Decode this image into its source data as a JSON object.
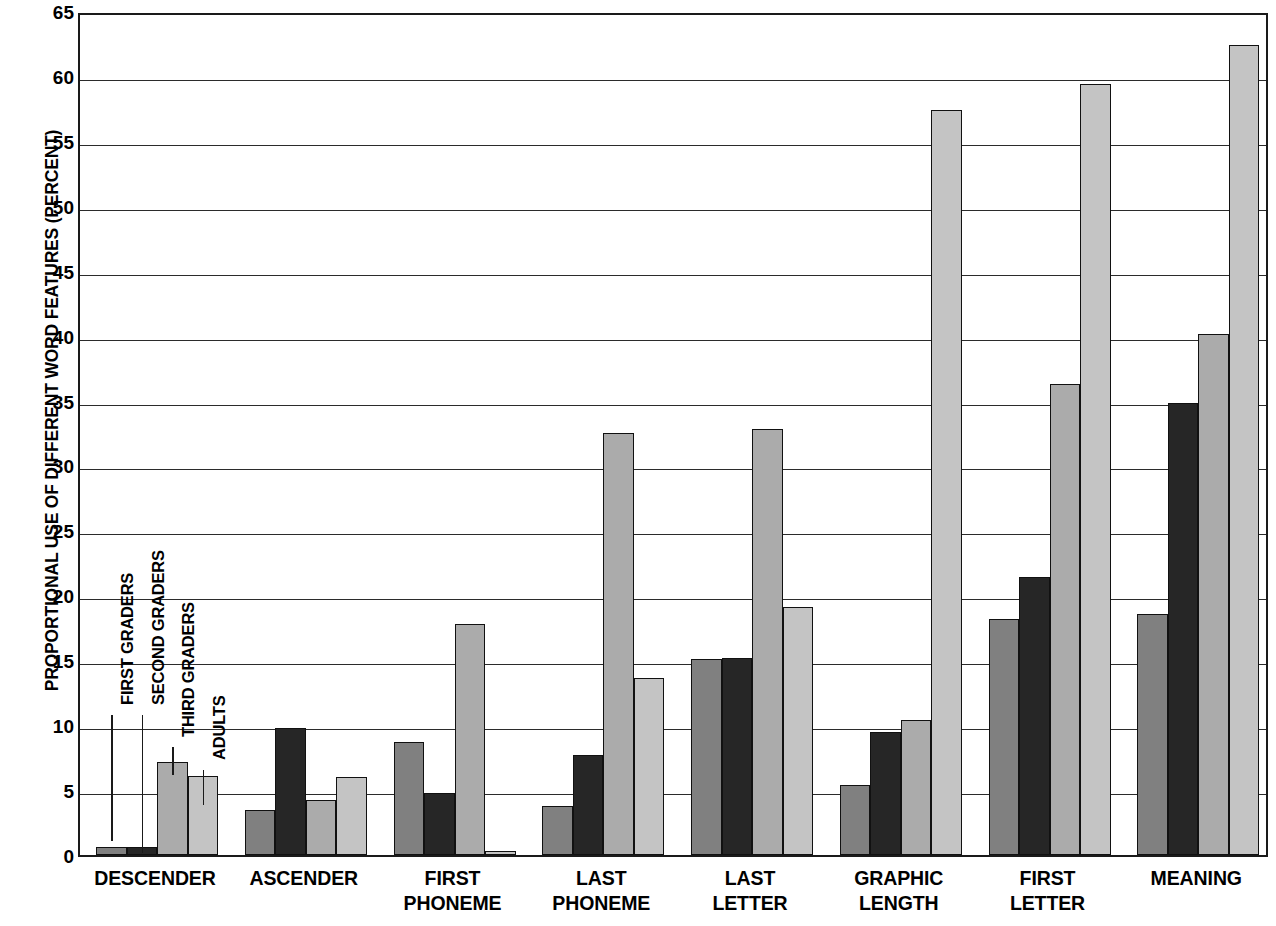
{
  "chart_data": {
    "type": "bar",
    "title": "",
    "xlabel": "",
    "ylabel": "PROPORTIONAL USE OF DIFFERENT WORD FEATURES (PERCENT)",
    "ylim": [
      0,
      65
    ],
    "ytick_step": 5,
    "yticks": [
      0,
      5,
      10,
      15,
      20,
      25,
      30,
      35,
      40,
      45,
      50,
      55,
      60,
      65
    ],
    "ytick_labels": [
      "0",
      "5",
      "10",
      "15",
      "20",
      "25",
      "30",
      "35",
      "40",
      "45",
      "50",
      "55",
      "60",
      "65"
    ],
    "grid": true,
    "legend_position": "inline-left",
    "categories": [
      "DESCENDER",
      "ASCENDER",
      "FIRST PHONEME",
      "LAST PHONEME",
      "LAST LETTER",
      "GRAPHIC LENGTH",
      "FIRST LETTER",
      "MEANING"
    ],
    "category_lines": [
      [
        "DESCENDER"
      ],
      [
        "ASCENDER"
      ],
      [
        "FIRST",
        "PHONEME"
      ],
      [
        "LAST",
        "PHONEME"
      ],
      [
        "LAST",
        "LETTER"
      ],
      [
        "GRAPHIC",
        "LENGTH"
      ],
      [
        "FIRST",
        "LETTER"
      ],
      [
        "MEANING"
      ]
    ],
    "series": [
      {
        "name": "FIRST GRADERS",
        "color": "#808080",
        "values": [
          0.6,
          3.5,
          8.7,
          3.8,
          15.1,
          5.4,
          18.2,
          18.6
        ]
      },
      {
        "name": "SECOND GRADERS",
        "color": "#262626",
        "values": [
          0.6,
          9.8,
          4.8,
          7.7,
          15.2,
          9.5,
          21.4,
          34.8
        ]
      },
      {
        "name": "THIRD GRADERS",
        "color": "#ababab",
        "values": [
          7.2,
          4.2,
          17.8,
          32.5,
          32.8,
          10.4,
          36.3,
          40.1
        ]
      },
      {
        "name": "ADULTS",
        "color": "#c4c4c4",
        "values": [
          6.1,
          6.0,
          0.3,
          13.6,
          19.1,
          57.4,
          59.4,
          62.4
        ]
      }
    ]
  }
}
